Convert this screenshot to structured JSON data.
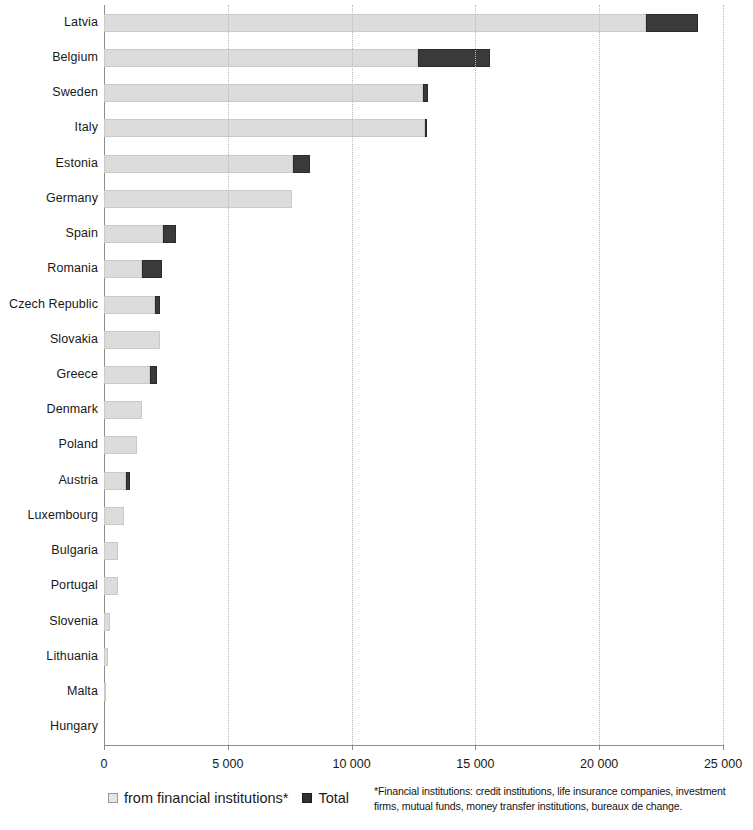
{
  "chart_data": {
    "type": "bar",
    "orientation": "horizontal",
    "stacked": true,
    "title": "",
    "xlabel": "",
    "ylabel": "",
    "xlim": [
      0,
      25000
    ],
    "xticks": [
      "0",
      "5000",
      "10000",
      "15000",
      "20000",
      "25000"
    ],
    "xtick_values": [
      0,
      5000,
      10000,
      15000,
      20000,
      25000
    ],
    "grid": true,
    "grid_axis": "x",
    "legend_position": "bottom-left",
    "categories": [
      "Latvia",
      "Belgium",
      "Sweden",
      "Italy",
      "Estonia",
      "Germany",
      "Spain",
      "Romania",
      "Czech Republic",
      "Slovakia",
      "Greece",
      "Denmark",
      "Poland",
      "Austria",
      "Luxembourg",
      "Bulgaria",
      "Portugal",
      "Slovenia",
      "Lithuania",
      "Malta",
      "Hungary"
    ],
    "series": [
      {
        "name": "from financial institutions*",
        "color": "#dcdcdc",
        "values": [
          21900,
          12700,
          12900,
          12950,
          7650,
          7600,
          2400,
          1550,
          2050,
          2250,
          1850,
          1550,
          1350,
          900,
          800,
          560,
          560,
          230,
          160,
          60,
          0
        ]
      },
      {
        "name": "Total",
        "color": "#3a3a3a",
        "values": [
          24000,
          15600,
          13100,
          13000,
          8300,
          7600,
          2900,
          2350,
          2250,
          2250,
          2150,
          1550,
          1350,
          1050,
          800,
          560,
          560,
          230,
          160,
          60,
          0
        ]
      }
    ]
  },
  "legend": {
    "items": [
      {
        "label": "from financial institutions*",
        "swatch": "light"
      },
      {
        "label": "Total",
        "swatch": "dark"
      }
    ]
  },
  "footnote": {
    "text": "*Financial institutions: credit institutions, life insurance companies, investment firms, mutual funds, money transfer institutions, bureaux de change."
  }
}
